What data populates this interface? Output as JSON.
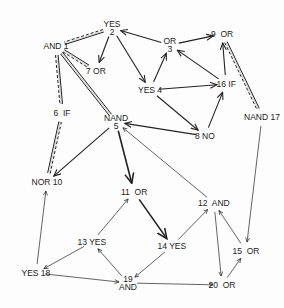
{
  "diagram": {
    "nodes": [
      {
        "id": "1",
        "label": "AND 1",
        "x": 56,
        "y": 46
      },
      {
        "id": "2",
        "label_top": "YES",
        "label": "2",
        "x": 112,
        "y": 28
      },
      {
        "id": "3",
        "label_top": "OR",
        "label": "3",
        "x": 170,
        "y": 45
      },
      {
        "id": "4",
        "label": "YES 4",
        "x": 150,
        "y": 90
      },
      {
        "id": "5",
        "label_top": "NAND",
        "label": "5",
        "x": 116,
        "y": 122
      },
      {
        "id": "6",
        "label": "6  IF",
        "x": 62,
        "y": 113
      },
      {
        "id": "7",
        "label": "7 OR",
        "x": 96,
        "y": 71
      },
      {
        "id": "8",
        "label": "8 NO",
        "x": 205,
        "y": 136
      },
      {
        "id": "9",
        "label": "9  OR",
        "x": 222,
        "y": 34
      },
      {
        "id": "10",
        "label": "NOR 10",
        "x": 47,
        "y": 182
      },
      {
        "id": "11",
        "label": "11  OR",
        "x": 134,
        "y": 192
      },
      {
        "id": "12",
        "label": "12  AND",
        "x": 214,
        "y": 203
      },
      {
        "id": "13",
        "label": "13 YES",
        "x": 92,
        "y": 242
      },
      {
        "id": "14",
        "label": "14 YES",
        "x": 172,
        "y": 246
      },
      {
        "id": "15",
        "label": "15  OR",
        "x": 246,
        "y": 251
      },
      {
        "id": "16",
        "label": "16 IF",
        "x": 226,
        "y": 84
      },
      {
        "id": "17",
        "label": "NAND 17",
        "x": 262,
        "y": 117
      },
      {
        "id": "18",
        "label": "YES 18",
        "x": 36,
        "y": 273
      },
      {
        "id": "19",
        "label": "19",
        "label_bottom": "AND",
        "x": 128,
        "y": 283
      },
      {
        "id": "20",
        "label": "20  OR",
        "x": 222,
        "y": 285
      }
    ],
    "edges": [
      {
        "from": "2",
        "to": "1",
        "style": "double-dashed"
      },
      {
        "from": "1",
        "to": "7",
        "style": "double-dashed"
      },
      {
        "from": "1",
        "to": "6",
        "style": "double-dashed"
      },
      {
        "from": "5",
        "to": "1",
        "style": "double"
      },
      {
        "from": "10",
        "to": "6",
        "style": "double-dashed"
      },
      {
        "from": "9",
        "to": "17",
        "style": "double-dashed"
      },
      {
        "from": "3",
        "to": "2",
        "style": "single"
      },
      {
        "from": "2",
        "to": "7",
        "style": "single"
      },
      {
        "from": "2",
        "to": "4",
        "style": "single"
      },
      {
        "from": "4",
        "to": "3",
        "style": "single"
      },
      {
        "from": "3",
        "to": "9",
        "style": "single"
      },
      {
        "from": "4",
        "to": "16",
        "style": "single"
      },
      {
        "from": "16",
        "to": "3",
        "style": "single"
      },
      {
        "from": "16",
        "to": "9",
        "style": "single"
      },
      {
        "from": "4",
        "to": "8",
        "style": "single"
      },
      {
        "from": "8",
        "to": "16",
        "style": "single"
      },
      {
        "from": "8",
        "to": "5",
        "style": "single"
      },
      {
        "from": "5",
        "to": "10",
        "style": "single"
      },
      {
        "from": "5",
        "to": "11",
        "style": "bold"
      },
      {
        "from": "11",
        "to": "14",
        "style": "bold"
      },
      {
        "from": "12",
        "to": "5",
        "style": "thin"
      },
      {
        "from": "17",
        "to": "15",
        "style": "thin"
      },
      {
        "from": "15",
        "to": "12",
        "style": "thin"
      },
      {
        "from": "12",
        "to": "20",
        "style": "thin"
      },
      {
        "from": "20",
        "to": "15",
        "style": "thin"
      },
      {
        "from": "14",
        "to": "12",
        "style": "thin"
      },
      {
        "from": "14",
        "to": "19",
        "style": "thin"
      },
      {
        "from": "19",
        "to": "13",
        "style": "thin"
      },
      {
        "from": "13",
        "to": "11",
        "style": "thin"
      },
      {
        "from": "13",
        "to": "18",
        "style": "thin"
      },
      {
        "from": "18",
        "to": "10",
        "style": "thin"
      },
      {
        "from": "18",
        "to": "19",
        "style": "thin"
      },
      {
        "from": "19",
        "to": "20",
        "style": "thin"
      }
    ]
  }
}
